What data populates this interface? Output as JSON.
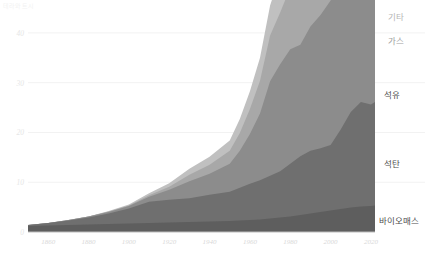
{
  "chart_data": {
    "type": "area",
    "title": "",
    "unit_label": "테라와트시",
    "xlabel": "",
    "ylabel": "",
    "stacked": true,
    "grid": true,
    "legend_position": "right-inline",
    "xlim": [
      1850,
      2022
    ],
    "ylim": [
      0,
      45
    ],
    "x_ticks": [
      1860,
      1880,
      1900,
      1920,
      1940,
      1960,
      1980,
      2000,
      2020
    ],
    "x_tick_labels": [
      "1860",
      "1880",
      "1900",
      "1920",
      "1940",
      "1960",
      "1980",
      "2000",
      "2020"
    ],
    "y_ticks": [
      0,
      10,
      20,
      30,
      40
    ],
    "y_tick_labels": [
      "0",
      "10",
      "20",
      "30",
      "40"
    ],
    "x": [
      1850,
      1860,
      1870,
      1880,
      1890,
      1900,
      1910,
      1920,
      1930,
      1940,
      1950,
      1955,
      1960,
      1965,
      1970,
      1975,
      1980,
      1985,
      1990,
      1995,
      2000,
      2005,
      2010,
      2015,
      2020,
      2022
    ],
    "series": [
      {
        "name": "바이오매스",
        "color": "#5e5e5e",
        "label_color": "#4d4d4d",
        "values": [
          1.2,
          1.3,
          1.4,
          1.5,
          1.6,
          1.7,
          1.8,
          1.9,
          2.0,
          2.1,
          2.2,
          2.3,
          2.4,
          2.5,
          2.7,
          2.9,
          3.1,
          3.4,
          3.7,
          4.0,
          4.3,
          4.6,
          4.9,
          5.1,
          5.2,
          5.3
        ]
      },
      {
        "name": "석탄",
        "color": "#6f6f6f",
        "label_color": "#4d4d4d",
        "values": [
          0.2,
          0.5,
          0.9,
          1.4,
          2.1,
          3.0,
          4.3,
          4.6,
          4.8,
          5.4,
          5.9,
          6.6,
          7.3,
          7.9,
          8.6,
          9.3,
          10.6,
          11.8,
          12.6,
          12.8,
          13.2,
          16.0,
          19.2,
          21.0,
          20.4,
          20.8
        ]
      },
      {
        "name": "석유",
        "color": "#8c8c8c",
        "label_color": "#4d4d4d",
        "values": [
          0.0,
          0.0,
          0.1,
          0.2,
          0.3,
          0.5,
          1.0,
          2.0,
          3.4,
          4.2,
          5.6,
          7.4,
          10.0,
          13.4,
          19.0,
          21.5,
          23.0,
          22.4,
          25.0,
          26.8,
          29.0,
          31.5,
          33.0,
          34.6,
          32.0,
          34.0
        ]
      },
      {
        "name": "가스",
        "color": "#a8a8a8",
        "label_color": "#9e9e9e",
        "values": [
          0.0,
          0.0,
          0.0,
          0.0,
          0.1,
          0.1,
          0.3,
          0.6,
          1.3,
          1.8,
          2.6,
          3.6,
          5.0,
          6.6,
          9.2,
          10.4,
          12.4,
          13.8,
          16.2,
          17.6,
          19.4,
          21.6,
          24.2,
          25.8,
          26.8,
          27.6
        ]
      },
      {
        "name": "기타",
        "color": "#c0c0c0",
        "label_color": "#b5b5b5",
        "values": [
          0.0,
          0.0,
          0.0,
          0.0,
          0.1,
          0.2,
          0.4,
          0.7,
          1.2,
          1.6,
          2.1,
          2.8,
          3.6,
          4.6,
          6.0,
          7.6,
          9.4,
          11.8,
          13.6,
          15.2,
          16.6,
          18.0,
          20.0,
          22.4,
          24.6,
          26.4
        ]
      }
    ],
    "series_label_positions": [
      {
        "name": "기타",
        "x": 388,
        "y": 10
      },
      {
        "name": "가스",
        "x": 388,
        "y": 34
      },
      {
        "name": "석유",
        "x": 384,
        "y": 88
      },
      {
        "name": "석탄",
        "x": 384,
        "y": 157
      },
      {
        "name": "바이오매스",
        "x": 379,
        "y": 214
      }
    ]
  }
}
